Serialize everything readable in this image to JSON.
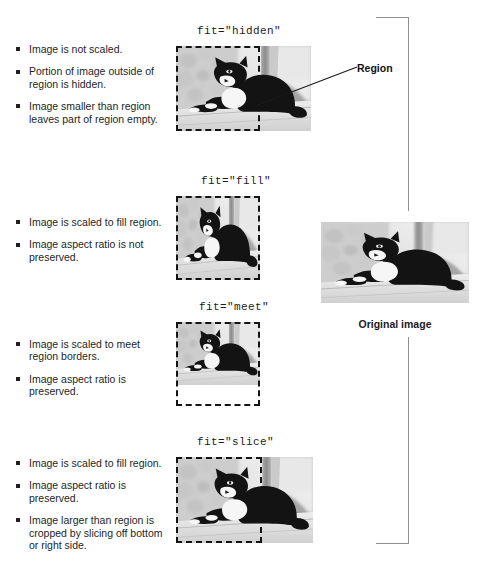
{
  "figure": {
    "title_labels": {
      "hidden": "fit=\"hidden\"",
      "fill": "fit=\"fill\"",
      "meet": "fit=\"meet\"",
      "slice": "fit=\"slice\""
    },
    "callout": {
      "region_label": "Region"
    },
    "original": {
      "caption": "Original image"
    },
    "sections": [
      {
        "id": "hidden",
        "label": "fit=\"hidden\"",
        "bullets": [
          "Image is not scaled.",
          "Portion of image outside of region is hidden.",
          "Image smaller than region leaves part of region empty."
        ]
      },
      {
        "id": "fill",
        "label": "fit=\"fill\"",
        "bullets": [
          "Image is scaled to fill region.",
          "Image aspect ratio is not preserved."
        ]
      },
      {
        "id": "meet",
        "label": "fit=\"meet\"",
        "bullets": [
          "Image is scaled to meet region borders.",
          "Image aspect ratio is preserved."
        ]
      },
      {
        "id": "slice",
        "label": "fit=\"slice\"",
        "bullets": [
          "Image is scaled to fill region.",
          "Image aspect ratio is preserved.",
          "Image larger than region is cropped by slicing off bottom or right side."
        ]
      }
    ],
    "colors": {
      "text": "#221f1f",
      "dashed_border": "#141414",
      "bracket": "#8e8e8e",
      "background": "#ffffff"
    }
  }
}
